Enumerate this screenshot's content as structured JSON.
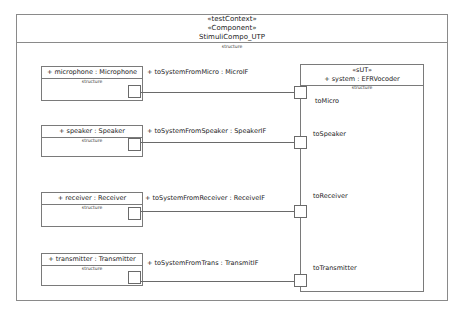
{
  "frame": {
    "stereotypes": [
      "«testContext»",
      "«Component»"
    ],
    "name": "StimuliCompo_UTP",
    "compartment": "structure"
  },
  "parts": [
    {
      "label": "+ microphone : Microphone",
      "compartment": "structure",
      "connector": "+ toSystemFromMicro : MicroIF",
      "sut_port": "toMicro"
    },
    {
      "label": "+ speaker : Speaker",
      "compartment": "structure",
      "connector": "+ toSystemFromSpeaker : SpeakerIF",
      "sut_port": "toSpeaker"
    },
    {
      "label": "+ receiver : Receiver",
      "compartment": "structure",
      "connector": "+ toSystemFromReceiver : ReceiveIF",
      "sut_port": "toReceiver"
    },
    {
      "label": "+ transmitter : Transmitter",
      "compartment": "structure",
      "connector": "+ toSystemFromTrans : TransmitIF",
      "sut_port": "toTransmitter"
    }
  ],
  "sut": {
    "stereotype": "«sUT»",
    "label": "+ system : EFRVocoder",
    "compartment": "structure"
  }
}
